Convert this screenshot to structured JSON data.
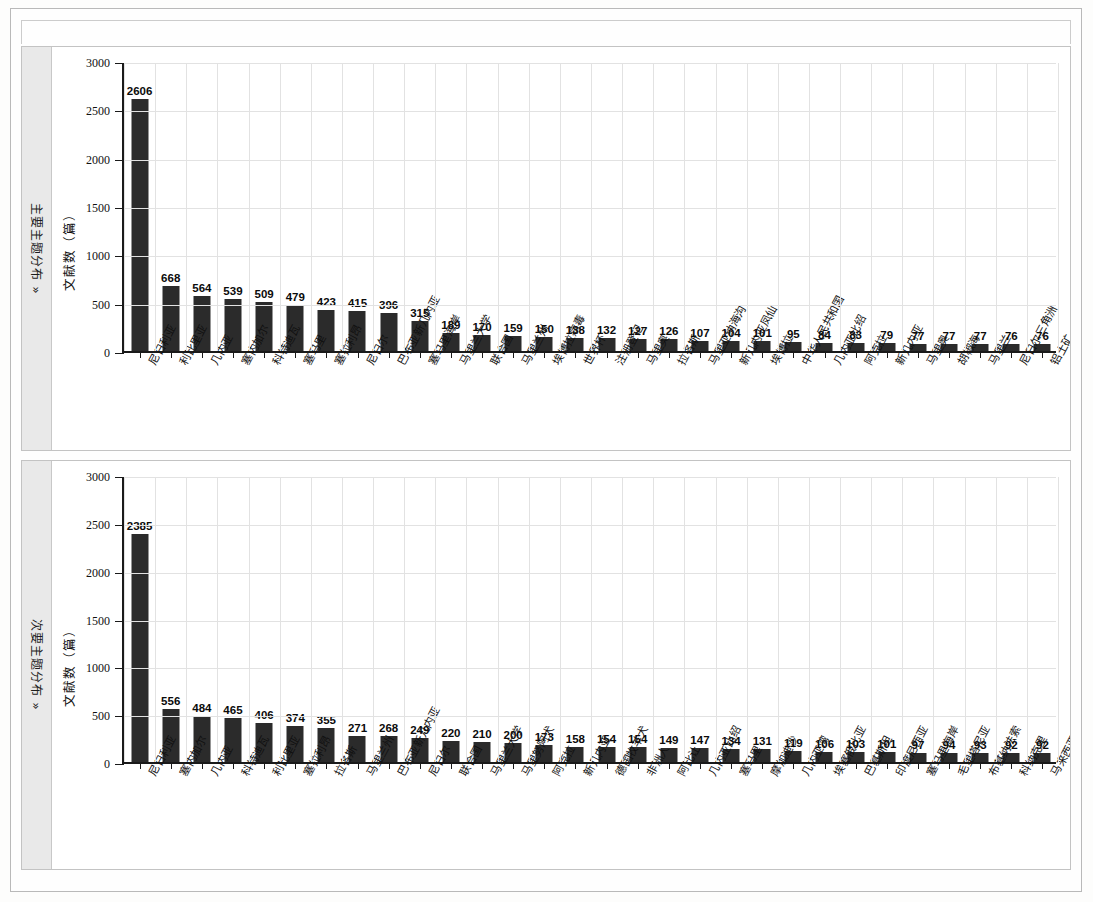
{
  "page": {
    "caption": ""
  },
  "panels": [
    {
      "side_label": "主要主题分布 »",
      "y_axis_title": "文献数（篇）",
      "chart_index": 0
    },
    {
      "side_label": "次要主题分布 »",
      "y_axis_title": "文献数（篇）",
      "chart_index": 1
    }
  ],
  "chart_data": [
    {
      "type": "bar",
      "title": "主要主题分布",
      "xlabel": "",
      "ylabel": "文献数（篇）",
      "ylim": [
        0,
        3000
      ],
      "yticks": [
        0,
        500,
        1000,
        1500,
        2000,
        2500,
        3000
      ],
      "grid": true,
      "legend": null,
      "bar_color": "#2b2b2b",
      "categories": [
        "尼日利亚",
        "利比里亚",
        "几内亚",
        "塞内加尔",
        "科特迪瓦",
        "塞马里",
        "塞拉利昂",
        "尼日尔",
        "巴布亚新几内亚",
        "塞马里海岸",
        "马里兰大学",
        "联合国",
        "马里兰州",
        "埃博拉病毒",
        "世界杯",
        "注册登记",
        "马里奥",
        "拉各斯",
        "马里亚纳海沟",
        "新几内亚凤仙",
        "埃博拉",
        "中华人民共和国",
        "几内亚比绍",
        "阿克拉",
        "新几内亚",
        "马里奥",
        "胡椒海",
        "马里兰",
        "尼日尔三角洲",
        "铝土矿"
      ],
      "values": [
        2606,
        668,
        564,
        539,
        509,
        479,
        423,
        415,
        396,
        315,
        189,
        170,
        159,
        150,
        138,
        132,
        127,
        126,
        107,
        104,
        101,
        95,
        84,
        83,
        79,
        77,
        77,
        77,
        76,
        76
      ]
    },
    {
      "type": "bar",
      "title": "次要主题分布",
      "xlabel": "",
      "ylabel": "文献数（篇）",
      "ylim": [
        0,
        3000
      ],
      "yticks": [
        0,
        500,
        1000,
        1500,
        2000,
        2500,
        3000
      ],
      "grid": true,
      "legend": null,
      "bar_color": "#2b2b2b",
      "categories": [
        "尼日利亚",
        "塞内加尔",
        "几内亚",
        "科特迪瓦",
        "利比里亚",
        "塞拉利昂",
        "拉各斯",
        "马里兰州",
        "巴布亚新几内亚",
        "尼日尔",
        "联合国",
        "马里兰大学",
        "马里努阿犬",
        "阿克拉",
        "新几内亚",
        "德国牧羊犬",
        "非洲人",
        "阿比让",
        "几内亚比绍",
        "塞马里",
        "摩加迪沙",
        "几内亚湾",
        "埃塞俄比亚",
        "巴基斯坦",
        "印度尼西亚",
        "塞马里海岸",
        "毛里塔尼亚",
        "布基纳法索",
        "科纳克里",
        "马来西亚"
      ],
      "values": [
        2385,
        556,
        484,
        465,
        406,
        374,
        355,
        271,
        268,
        249,
        220,
        210,
        200,
        173,
        158,
        154,
        154,
        149,
        147,
        134,
        131,
        119,
        106,
        103,
        101,
        97,
        94,
        93,
        92,
        92
      ]
    }
  ]
}
